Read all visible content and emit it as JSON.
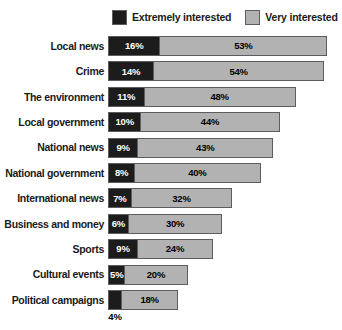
{
  "legend": {
    "items": [
      {
        "label": "Extremely interested",
        "color": "#1c1c1c",
        "name": "extremely-interested"
      },
      {
        "label": "Very interested",
        "color": "#b2b2b2",
        "name": "very-interested"
      }
    ]
  },
  "chart_data": {
    "type": "bar",
    "orientation": "horizontal",
    "stacked": true,
    "title": "",
    "subtitle": "",
    "xlabel": "",
    "ylabel": "",
    "xlim": [
      0,
      72
    ],
    "grid": false,
    "legend_position": "top",
    "value_suffix": "%",
    "categories": [
      "Local news",
      "Crime",
      "The environment",
      "Local government",
      "National news",
      "National government",
      "International news",
      "Business and money",
      "Sports",
      "Cultural events",
      "Political campaigns"
    ],
    "series": [
      {
        "name": "Extremely interested",
        "color": "#1c1c1c",
        "values": [
          16,
          14,
          11,
          10,
          9,
          8,
          7,
          6,
          9,
          5,
          4
        ],
        "labels": [
          "16%",
          "14%",
          "11%",
          "10%",
          "9%",
          "8%",
          "7%",
          "6%",
          "9%",
          "5%",
          "4%"
        ]
      },
      {
        "name": "Very interested",
        "color": "#b2b2b2",
        "values": [
          53,
          54,
          48,
          44,
          43,
          40,
          32,
          30,
          24,
          20,
          18
        ],
        "labels": [
          "53%",
          "54%",
          "48%",
          "44%",
          "43%",
          "40%",
          "32%",
          "30%",
          "24%",
          "20%",
          "18%"
        ]
      }
    ],
    "totals": [
      69,
      68,
      59,
      54,
      52,
      48,
      39,
      36,
      33,
      25,
      22
    ],
    "annotations": [
      {
        "category": "Political campaigns",
        "series": "Extremely interested",
        "text": "4%",
        "placement": "below-bar"
      }
    ]
  }
}
